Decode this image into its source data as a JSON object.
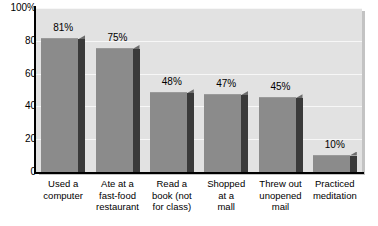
{
  "chart_data": {
    "type": "bar",
    "title": "",
    "subtitle": "",
    "xlabel": "",
    "ylabel": "",
    "ylim": [
      0,
      100
    ],
    "grid": true,
    "legend": false,
    "legend_position": "none",
    "categories": [
      "Used a\ncomputer",
      "Ate at a\nfast-food\nrestaurant",
      "Read a\nbook (not\nfor class)",
      "Shopped\nat a\nmall",
      "Threw out\nunopened\nmail",
      "Practiced\nmeditation"
    ],
    "values": [
      81,
      75,
      48,
      47,
      45,
      10
    ],
    "data_labels": [
      "81%",
      "75%",
      "48%",
      "47%",
      "45%",
      "10%"
    ],
    "y_ticks": [
      0,
      20,
      40,
      60,
      80,
      100
    ],
    "y_tick_labels": [
      "0",
      "20",
      "40",
      "60",
      "80",
      "100%"
    ]
  },
  "style": {
    "bar_face_color": "#8b8b8b",
    "bar_side_color": "#3a3a3a",
    "plot_background": "#e2e2e2",
    "gridline_color": "#f7f7f7",
    "axis_color": "#000000",
    "text_color": "#000000",
    "page_background": "#ffffff"
  }
}
